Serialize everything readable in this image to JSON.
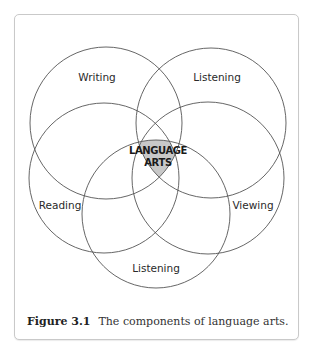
{
  "diagram": {
    "type": "venn",
    "center_label": {
      "line1": "LANGUAGE",
      "line2": "ARTS"
    },
    "circles": [
      {
        "label": "Writing",
        "cx": 106,
        "cy": 123,
        "r": 76
      },
      {
        "label": "Listening",
        "cx": 211,
        "cy": 123,
        "r": 75
      },
      {
        "label": "Reading",
        "cx": 104,
        "cy": 178,
        "r": 75
      },
      {
        "label": "Viewing",
        "cx": 208,
        "cy": 178,
        "r": 76
      },
      {
        "label": "Listening",
        "cx": 156,
        "cy": 214,
        "r": 74
      }
    ],
    "colors": {
      "stroke": "#555555",
      "overlap_fill": "#c8c8c8",
      "frame_border": "#c9c9c9"
    }
  },
  "caption": {
    "figure_number": "Figure 3.1",
    "text": "The components of language arts."
  }
}
